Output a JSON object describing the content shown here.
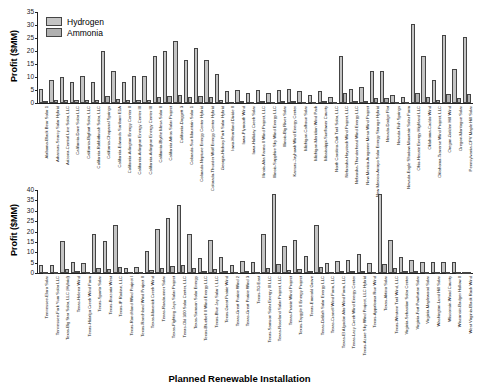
{
  "chart_data": [
    {
      "type": "bar",
      "title": "",
      "xlabel": "",
      "ylabel": "Profit ($MM)",
      "ylim": [
        0,
        35
      ],
      "yticks": [
        0,
        5,
        10,
        15,
        20,
        25,
        30,
        35
      ],
      "grid": false,
      "legend_position": "upper left",
      "categories": [
        "Alabama-Black Bear Solar 1",
        "Arkansas-Searcy Solar Hybrid",
        "Arizona-Central Line Solar, LLC",
        "California-Dove Solar LLC",
        "California-Bigfoot Solar, LLC",
        "California-Rabbitbrush Solar, LLC",
        "California-Chaparral Springs",
        "California-Edwards Sanborn E1A",
        "California-Arlington Energy Center II",
        "California-Arlington Energy Center III",
        "California-Arlington Energy Center III",
        "California-Blythe Mesa Solar II",
        "California Athos Solar Project",
        "California-Daggett 3",
        "Colorado-Sun Mountain Solar 1",
        "Colorado-Neptune Energy Center Hybrid",
        "Colorado-Thunder Wolf Energy Center Hybrid",
        "Georgia-Hickory Park Solar Hybrid",
        "Iowa-Heartland Divide II",
        "Iowa-Plymouth Wind",
        "Iowa-Holliday Creek Solar",
        "Illinois-Alta Farms II Wind Project, LLC",
        "Illinois-Sapphire Sky Wind Energy LLC",
        "Illinois-Big River Solar",
        "Kansas-Jayhawk Wind Energy Center",
        "Michigan-Calhoun Solar",
        "Michigan-Meridian Wind Park",
        "Mississippi-Sunflower County",
        "North Carolina-Oak Trail Solar, LLC",
        "Nebraska-Haystack Wind Project, LLC",
        "Nebraska-Thunderhead Wind Energy LLC",
        "New Mexico-Aragonne Mesa Wind Project",
        "New Mexico-Arroyo Solar Energy Storage Hybrid",
        "Nevada-Dodge Flat",
        "Nevada-Fish Springs",
        "Nevada-Eagle Shadow Mountain Solar Farm",
        "Ohio-Hecate Energy Highland LLC",
        "Oklahoma-Caddo Wind",
        "Oklahoma-Traverse Wind Project, LLC",
        "Oregon-Golden Hill Wind",
        "Oregon-Montague Solar",
        "Pennsylvania-CPV Maple Hill Solar"
      ],
      "series": [
        {
          "name": "Hydrogen",
          "values": [
            5.5,
            9,
            10,
            8,
            10.5,
            8,
            20,
            12.5,
            8,
            10.5,
            10.5,
            18,
            20,
            24,
            16.5,
            21,
            16.5,
            11,
            4.5,
            5,
            4,
            5,
            4,
            5,
            5.5,
            4.5,
            3,
            4.5,
            2.5,
            18,
            5.5,
            6,
            12.5,
            12.5,
            3,
            2.5,
            30.5,
            18,
            9,
            26,
            13,
            25.5
          ]
        },
        {
          "name": "Ammonia",
          "values": [
            0.8,
            1,
            1.3,
            1.2,
            1.3,
            1.1,
            2.6,
            1.7,
            1.1,
            1.3,
            1.3,
            2.3,
            2.6,
            3,
            2.2,
            2.8,
            2.2,
            1.2,
            0.5,
            0.6,
            0.5,
            0.6,
            0.5,
            0.6,
            0.7,
            0.5,
            0.4,
            0.6,
            0.3,
            4,
            0.7,
            0.7,
            2,
            2,
            0.4,
            0.3,
            4,
            2.2,
            1,
            3.4,
            1.8,
            3.5
          ]
        }
      ]
    },
    {
      "type": "bar",
      "title": "",
      "xlabel": "Planned Renewable Installation",
      "ylabel": "Profit ($MM)",
      "ylim": [
        0,
        40
      ],
      "yticks": [
        0,
        5,
        10,
        15,
        20,
        25,
        30,
        35,
        40
      ],
      "grid": false,
      "categories": [
        "Tennessee-Elora Solar",
        "Tennessee-Fork Yum Solar LLC",
        "Texas-Big Star Solar, LLC (Hybrid)",
        "Texas-Helena Wind",
        "Texas-Hidalgo Creek Wind Farm",
        "Texas-Sparta Solar",
        "Texas-Brazoria West",
        "Texas-IP Radian, LLC",
        "Texas-Ranchland Wind Project I",
        "Texas-Ranchland Wind Project II",
        "Texas-Maverick Creek Wind",
        "Texas-Roadrunner Solar",
        "Texas-Fighting Jays Solar Project",
        "Texas-Old 300 Solar Center, LLC",
        "Texas-Samson Solar Energy",
        "Texas-Bluebell II Wind Energy LLC",
        "Texas-Blue Jay Solar I, LLC",
        "Texas-Great Prairie Wind",
        "Texas-Great Prairie Wind 2",
        "Texas-Great Prairie Wind 3",
        "Texas-TG East",
        "Texas-Samson Solar Energy III LLC",
        "Texas-Roseland Solar Project, LLC",
        "Texas-Prairie Wind Project",
        "Texas-Tayggle II Energy Project",
        "Texas-Emerald Grove",
        "Texas-Delilah Solar Energy LLC",
        "Texas-Cranell Wind Farm, LLC",
        "Texas-El Algodon Alto Wind Farm, LLC",
        "Texas-Lazy Creek Wind Energy Center",
        "Texas-Azure Sky Wind Project, LLC Hybrid",
        "Texas-Appaloosa Run Wind",
        "Texas-Aktina Solar",
        "Texas-Western Trail Wind, LLC",
        "Virginia-Sebastian Solar Center",
        "Virginia-Fort Powhatan Solar",
        "Virginia-Maplewood Solar",
        "Washington-Lund Hill Solar",
        "Wisconsin-Wood County",
        "Wisconsin-Badger Hollow II",
        "West Virginia-Black Rock Wind"
      ],
      "series": [
        {
          "name": "Hydrogen",
          "values": [
            4,
            4,
            15.5,
            5.5,
            5,
            19,
            15.5,
            23,
            2.5,
            3,
            10.5,
            21,
            26.5,
            33,
            19,
            7,
            16,
            7.5,
            4,
            6,
            5.5,
            19,
            38,
            13,
            16,
            8,
            23,
            5,
            6,
            6.5,
            9,
            5,
            38,
            16,
            7.5,
            6.5,
            5.5,
            5.5,
            5.5,
            5.5,
            0.5
          ]
        },
        {
          "name": "Ammonia",
          "values": [
            0.5,
            0.5,
            2,
            0.8,
            0.6,
            2.4,
            2,
            3,
            0.3,
            0.4,
            1.5,
            2.6,
            3.2,
            3.8,
            2.4,
            1,
            2,
            1,
            0.5,
            0.8,
            0.7,
            2.3,
            4.3,
            1.6,
            2,
            1,
            2.8,
            0.6,
            0.8,
            0.8,
            1.2,
            0.6,
            4.5,
            2.2,
            1,
            0.8,
            0.7,
            0.7,
            0.7,
            0.7,
            0.1
          ]
        }
      ]
    }
  ],
  "legend": {
    "items": [
      {
        "label": "Hydrogen"
      },
      {
        "label": "Ammonia"
      }
    ]
  },
  "labels": {
    "ylabel_top": "Profit ($MM)",
    "ylabel_bottom": "Profit ($MM)",
    "xlabel": "Planned Renewable Installation"
  }
}
